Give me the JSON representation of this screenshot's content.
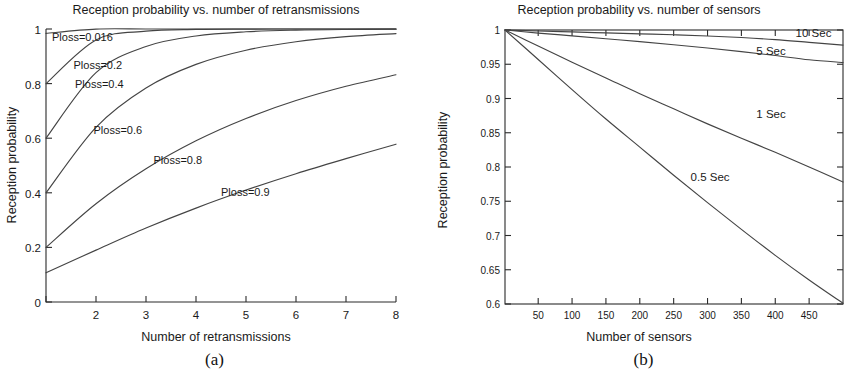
{
  "figure": {
    "panel_a_caption": "(a)",
    "panel_b_caption": "(b)"
  },
  "chart_data": [
    {
      "id": "panel-a",
      "type": "line",
      "title": "Reception probability vs. number of retransmissions",
      "xlabel": "Number of retransmissions",
      "ylabel": "Reception probability",
      "xlim": [
        1,
        8
      ],
      "ylim": [
        0,
        1
      ],
      "xticks": [
        1,
        2,
        3,
        4,
        5,
        6,
        7,
        8
      ],
      "xticklabels": [
        "",
        "2",
        "3",
        "4",
        "5",
        "6",
        "7",
        "8"
      ],
      "yticks": [
        0,
        0.2,
        0.4,
        0.6,
        0.8,
        1
      ],
      "yticklabels": [
        "0",
        "0.2",
        "0.4",
        "0.6",
        "0.8",
        "1"
      ],
      "grid": false,
      "legend": "inline-annotations",
      "x": [
        1,
        2,
        3,
        4,
        5,
        6,
        7,
        8
      ],
      "series": [
        {
          "name": "Ploss=0.016",
          "label": "Ploss=0.016",
          "values": [
            0.984,
            0.9997,
            1.0,
            1.0,
            1.0,
            1.0,
            1.0,
            1.0
          ],
          "label_x": 1.12,
          "label_y": 0.955
        },
        {
          "name": "Ploss=0.2",
          "label": "Ploss=0.2",
          "values": [
            0.8,
            0.96,
            0.992,
            0.9984,
            0.99968,
            0.999936,
            0.99998,
            1.0
          ],
          "label_x": 1.55,
          "label_y": 0.855
        },
        {
          "name": "Ploss=0.4",
          "label": "Ploss=0.4",
          "values": [
            0.6,
            0.84,
            0.936,
            0.9744,
            0.98976,
            0.9959,
            0.99836,
            0.99934
          ],
          "label_x": 1.58,
          "label_y": 0.785
        },
        {
          "name": "Ploss=0.6",
          "label": "Ploss=0.6",
          "values": [
            0.4,
            0.64,
            0.784,
            0.8704,
            0.92224,
            0.95334,
            0.97201,
            0.9832
          ],
          "label_x": 1.95,
          "label_y": 0.615
        },
        {
          "name": "Ploss=0.8",
          "label": "Ploss=0.8",
          "values": [
            0.2,
            0.36,
            0.488,
            0.5904,
            0.67232,
            0.73786,
            0.79028,
            0.83223
          ],
          "label_x": 3.15,
          "label_y": 0.505
        },
        {
          "name": "Ploss=0.9",
          "label": "Ploss=0.9",
          "values": [
            0.107,
            0.19,
            0.271,
            0.344,
            0.41,
            0.47,
            0.525,
            0.578
          ],
          "label_x": 4.5,
          "label_y": 0.39
        }
      ]
    },
    {
      "id": "panel-b",
      "type": "line",
      "title": "Reception probability vs. number of sensors",
      "xlabel": "Number of sensors",
      "ylabel": "Reception probability",
      "xlim": [
        1,
        500
      ],
      "ylim": [
        0.6,
        1
      ],
      "xticks": [
        50,
        100,
        150,
        200,
        250,
        300,
        350,
        400,
        450
      ],
      "xticklabels": [
        "50",
        "100",
        "150",
        "200",
        "250",
        "300",
        "350",
        "400",
        "450"
      ],
      "yticks": [
        0.6,
        0.65,
        0.7,
        0.75,
        0.8,
        0.85,
        0.9,
        0.95,
        1
      ],
      "yticklabels": [
        "0.6",
        "0.65",
        "0.7",
        "0.75",
        "0.8",
        "0.85",
        "0.9",
        "0.95",
        "1"
      ],
      "grid": false,
      "legend": "inline-annotations",
      "x": [
        1,
        50,
        100,
        150,
        200,
        250,
        300,
        350,
        400,
        450,
        500
      ],
      "series": [
        {
          "name": "10 Sec",
          "label": "10 Sec",
          "values": [
            1.0,
            0.9985,
            0.9972,
            0.9958,
            0.9944,
            0.993,
            0.9913,
            0.989,
            0.986,
            0.982,
            0.978
          ],
          "label_x": 430,
          "label_y": 0.9905
        },
        {
          "name": "5 Sec",
          "label": "5 Sec",
          "values": [
            1.0,
            0.9955,
            0.9915,
            0.9873,
            0.983,
            0.9785,
            0.9737,
            0.9685,
            0.9627,
            0.9565,
            0.9525
          ],
          "label_x": 372,
          "label_y": 0.964
        },
        {
          "name": "1 Sec",
          "label": "1 Sec",
          "values": [
            1.0,
            0.9765,
            0.953,
            0.93,
            0.907,
            0.885,
            0.863,
            0.842,
            0.8215,
            0.8,
            0.778
          ],
          "label_x": 372,
          "label_y": 0.8715
        },
        {
          "name": "0.5 Sec",
          "label": "0.5 Sec",
          "values": [
            1.0,
            0.957,
            0.913,
            0.87,
            0.829,
            0.788,
            0.748,
            0.709,
            0.671,
            0.635,
            0.601
          ],
          "label_x": 275,
          "label_y": 0.779
        }
      ]
    }
  ]
}
